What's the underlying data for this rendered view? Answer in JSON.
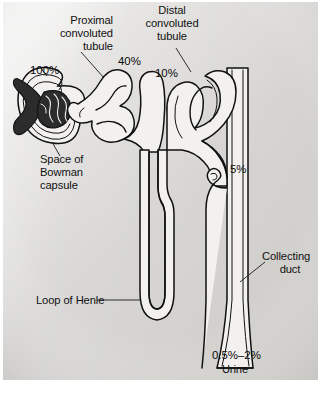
{
  "figure": {
    "background_color": "#d9d9d7",
    "ink_color": "#111111",
    "lumen_color": "#f2f1ef"
  },
  "labels": {
    "proximal_line1": "Proximal",
    "proximal_line2": "convoluted",
    "proximal_line3": "tubule",
    "distal_line1": "Distal",
    "distal_line2": "convoluted",
    "distal_line3": "tubule",
    "bowman_line1": "Space of",
    "bowman_line2": "Bowman",
    "bowman_line3": "capsule",
    "loop_of_henle": "Loop of Henle",
    "collecting_line1": "Collecting",
    "collecting_line2": "duct",
    "urine": "Urine"
  },
  "percentages": {
    "glomerulus": "100%",
    "proximal_end": "40%",
    "distal_start": "10%",
    "collecting_duct": "5%",
    "urine_range": "0.5%–2%"
  }
}
